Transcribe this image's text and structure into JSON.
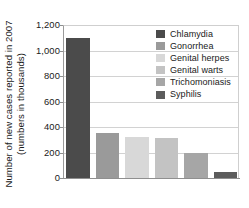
{
  "chart_data": {
    "type": "bar",
    "title": "",
    "xlabel": "",
    "ylabel": "Number of new cases reported in 2007 (numbers in thousands)",
    "ylabel_line1": "Number of new cases reported in 2007",
    "ylabel_line2": "(numbers in thousands)",
    "categories": [
      "Chlamydia",
      "Gonorrhea",
      "Genital herpes",
      "Genital warts",
      "Trichomoniasis",
      "Syphilis"
    ],
    "values": [
      1100,
      355,
      320,
      310,
      200,
      45
    ],
    "ylim": [
      0,
      1200
    ],
    "ytick_values": [
      0,
      200,
      400,
      600,
      800,
      1000,
      1200
    ],
    "ytick_labels": [
      "0",
      "200",
      "400",
      "600",
      "800",
      "1,000",
      "1,200"
    ],
    "grid": true,
    "legend_position": "upper right",
    "bar_colors": [
      "#4b4b4b",
      "#9a9a9a",
      "#d8d8d8",
      "#c3c3c3",
      "#a6a6a6",
      "#5c5c5c"
    ],
    "series": [
      {
        "name": "Chlamydia",
        "value": 1100,
        "color": "#4b4b4b"
      },
      {
        "name": "Gonorrhea",
        "value": 355,
        "color": "#9a9a9a"
      },
      {
        "name": "Genital herpes",
        "value": 320,
        "color": "#d8d8d8"
      },
      {
        "name": "Genital warts",
        "value": 310,
        "color": "#c3c3c3"
      },
      {
        "name": "Trichomoniasis",
        "value": 200,
        "color": "#a6a6a6"
      },
      {
        "name": "Syphilis",
        "value": 45,
        "color": "#5c5c5c"
      }
    ]
  },
  "legend": {
    "items": [
      {
        "label": "Chlamydia",
        "color": "#4b4b4b"
      },
      {
        "label": "Gonorrhea",
        "color": "#9a9a9a"
      },
      {
        "label": "Genital herpes",
        "color": "#d8d8d8"
      },
      {
        "label": "Genital warts",
        "color": "#c3c3c3"
      },
      {
        "label": "Trichomoniasis",
        "color": "#a6a6a6"
      },
      {
        "label": "Syphilis",
        "color": "#5c5c5c"
      }
    ]
  },
  "axis": {
    "y_title_line1": "Number of new cases reported in 2007",
    "y_title_line2": "(numbers in thousands)",
    "y_ticks": [
      "1,200",
      "1,000",
      "800",
      "600",
      "400",
      "200",
      "0"
    ]
  }
}
